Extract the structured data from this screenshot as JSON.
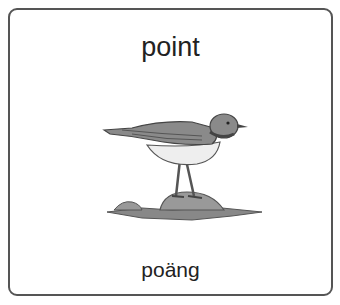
{
  "card": {
    "title": "point",
    "translation": "poäng",
    "image": "bird-on-rock-illustration",
    "border_color": "#555555"
  }
}
